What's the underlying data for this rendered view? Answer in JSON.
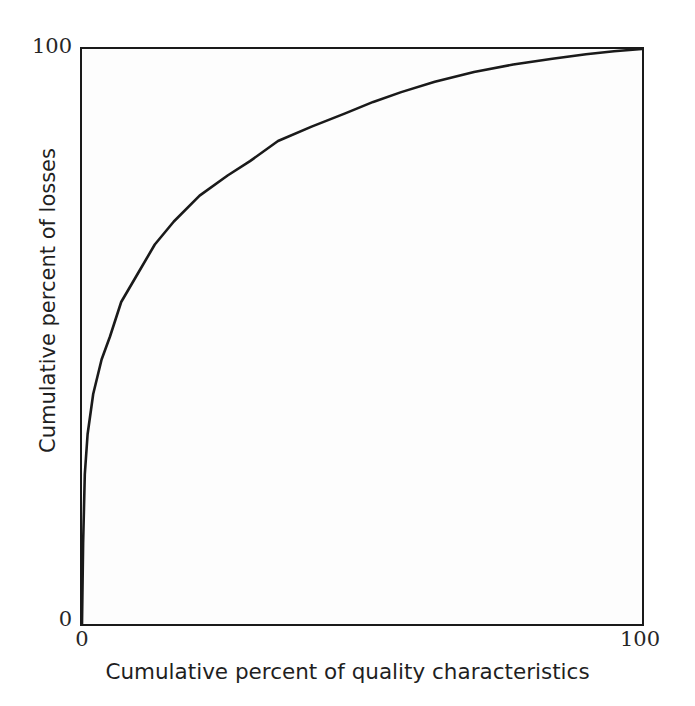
{
  "chart_data": {
    "type": "line",
    "title": "",
    "subtitle": "",
    "xlabel": "Cumulative percent of quality characteristics",
    "ylabel": "Cumulative percent of losses",
    "xlim": [
      0,
      100
    ],
    "ylim": [
      0,
      100
    ],
    "grid": false,
    "legend": false,
    "legend_position": "none",
    "annotations": [],
    "axis": {
      "x_ticks": [
        0,
        100
      ],
      "x_tick_labels": [
        "0",
        "100"
      ],
      "y_ticks": [
        0,
        100
      ],
      "y_tick_labels": [
        "0",
        "100"
      ]
    },
    "series": [
      {
        "name": "Cumulative loss curve",
        "color": "#1a1a1a",
        "line_width": 2.6,
        "x": [
          0,
          0.2,
          0.5,
          1,
          2,
          3.5,
          5,
          7,
          10,
          13,
          16.4,
          21,
          26,
          30,
          35,
          41,
          47,
          52,
          57,
          63,
          70,
          77,
          84,
          90,
          95,
          100
        ],
        "y": [
          0,
          14,
          26,
          33,
          40,
          46,
          50,
          56,
          61,
          66,
          70,
          74.5,
          78,
          80.5,
          84,
          86.5,
          88.8,
          90.8,
          92.5,
          94.3,
          96,
          97.3,
          98.3,
          99.1,
          99.6,
          100
        ]
      }
    ],
    "key_points": [
      {
        "x": 5,
        "y": 50
      },
      {
        "x": 10,
        "y": 61
      },
      {
        "x": 16,
        "y": 70
      },
      {
        "x": 35,
        "y": 84
      },
      {
        "x": 57,
        "y": 92.5
      },
      {
        "x": 100,
        "y": 100
      }
    ]
  },
  "figure": {
    "background_color": "#ffffff",
    "plot_background_color": "#fdfdfd",
    "frame_color": "#1a1a1a",
    "curve_color": "#1a1a1a",
    "text_color": "#1f1f1f"
  },
  "labels": {
    "y_axis_title": "Cumulative percent of losses",
    "x_axis_title": "Cumulative percent of quality characteristics",
    "y_tick_top": "100",
    "y_tick_bottom": "0",
    "x_tick_left": "0",
    "x_tick_right": "100"
  }
}
